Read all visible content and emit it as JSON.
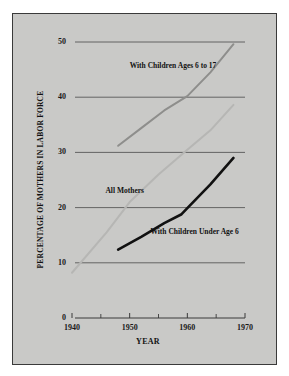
{
  "figure": {
    "background_color": "#ffffff",
    "panel_color": "#c9c9c7",
    "border_color": "#3a3a3a"
  },
  "chart_data": {
    "type": "line",
    "title": "",
    "subtitle": "",
    "xlabel": "YEAR",
    "ylabel": "PERCENTAGE OF MOTHERS IN LABOR FORCE",
    "xlim": [
      1940,
      1970
    ],
    "ylim": [
      0,
      50
    ],
    "grid": "horizontal",
    "legend": "inline-labels",
    "xticks": [
      1940,
      1950,
      1960,
      1970
    ],
    "xtick_labels": [
      "1940",
      "1950",
      "1960",
      "1970"
    ],
    "xminor_ticks": [
      1945,
      1955,
      1965
    ],
    "yticks": [
      0,
      10,
      20,
      30,
      40,
      50
    ],
    "ytick_labels": [
      "0",
      "10",
      "20",
      "30",
      "40",
      "50"
    ],
    "series": [
      {
        "name": "With Children Ages 6 to 17",
        "color": "#8e8e8c",
        "width": 2.0,
        "label_x": 1950.0,
        "label_y": 45.6,
        "points": [
          {
            "x": 1948,
            "y": 31.2
          },
          {
            "x": 1952,
            "y": 34.4
          },
          {
            "x": 1956,
            "y": 37.6
          },
          {
            "x": 1960,
            "y": 40.2
          },
          {
            "x": 1964,
            "y": 44.5
          },
          {
            "x": 1968,
            "y": 49.6
          }
        ]
      },
      {
        "name": "All Mothers",
        "color": "#b6b6b4",
        "width": 2.0,
        "label_x": 1945.8,
        "label_y": 23.0,
        "points": [
          {
            "x": 1940,
            "y": 8.2
          },
          {
            "x": 1946,
            "y": 15.5
          },
          {
            "x": 1950,
            "y": 21.0
          },
          {
            "x": 1955,
            "y": 26.0
          },
          {
            "x": 1960,
            "y": 30.5
          },
          {
            "x": 1964,
            "y": 34.0
          },
          {
            "x": 1968,
            "y": 38.6
          }
        ]
      },
      {
        "name": "With Children Under Age 6",
        "color": "#111111",
        "width": 2.6,
        "label_x": 1953.6,
        "label_y": 15.6,
        "points": [
          {
            "x": 1948,
            "y": 12.4
          },
          {
            "x": 1952,
            "y": 14.7
          },
          {
            "x": 1956,
            "y": 17.2
          },
          {
            "x": 1959,
            "y": 18.8
          },
          {
            "x": 1960,
            "y": 19.9
          },
          {
            "x": 1964,
            "y": 24.2
          },
          {
            "x": 1968,
            "y": 29.0
          }
        ]
      }
    ]
  }
}
